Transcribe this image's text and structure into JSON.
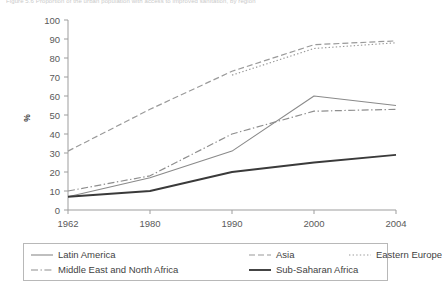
{
  "figure": {
    "title": "Figure 5.6 Proportion of the urban population with access to improved sanitation, by region"
  },
  "chart_data": {
    "type": "line",
    "title": "",
    "xlabel": "",
    "ylabel": "%",
    "x": [
      "1962",
      "1980",
      "1990",
      "2000",
      "2004"
    ],
    "xlim": [
      0,
      4
    ],
    "ylim": [
      0,
      100
    ],
    "ytick_labels": [
      "0",
      "10",
      "20",
      "30",
      "40",
      "50",
      "60",
      "70",
      "80",
      "90",
      "100"
    ],
    "yticks": [
      0,
      10,
      20,
      30,
      40,
      50,
      60,
      70,
      80,
      90,
      100
    ],
    "grid": false,
    "legend_position": "below",
    "series": [
      {
        "name": "Latin America",
        "style": "solid-thin",
        "color": "#8a8a8a",
        "x": [
          "1962",
          "1980",
          "1990",
          "2000",
          "2004"
        ],
        "values": [
          7,
          17,
          31,
          60,
          55
        ]
      },
      {
        "name": "Asia",
        "style": "dashed",
        "color": "#9a9a9a",
        "x": [
          "1962",
          "1980",
          "1990",
          "2000",
          "2004"
        ],
        "values": [
          31,
          53,
          73,
          87,
          89
        ]
      },
      {
        "name": "Eastern Europe",
        "style": "dotted",
        "color": "#9a9a9a",
        "x": [
          "1990",
          "2000",
          "2004"
        ],
        "values": [
          71,
          85,
          88
        ]
      },
      {
        "name": "Middle East and North Africa",
        "style": "dash-dot",
        "color": "#8e8e8e",
        "x": [
          "1962",
          "1980",
          "1990",
          "2000",
          "2004"
        ],
        "values": [
          10,
          18,
          40,
          52,
          53
        ]
      },
      {
        "name": "Sub-Saharan Africa",
        "style": "solid-thick",
        "color": "#3a3a3a",
        "x": [
          "1962",
          "1980",
          "1990",
          "2000",
          "2004"
        ],
        "values": [
          7,
          10,
          20,
          25,
          29
        ]
      }
    ]
  },
  "legend": {
    "rows": [
      [
        {
          "label": "Latin America",
          "style": "solid-thin"
        },
        {
          "label": "Asia",
          "style": "dashed"
        },
        {
          "label": "Eastern Europe",
          "style": "dotted"
        }
      ],
      [
        {
          "label": "Middle East and North Africa",
          "style": "dash-dot"
        },
        {
          "label": "Sub-Saharan Africa",
          "style": "solid-thick"
        }
      ]
    ]
  }
}
